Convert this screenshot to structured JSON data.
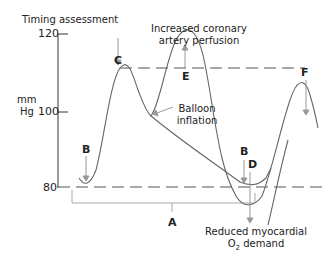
{
  "title": "Timing assessment",
  "y_axis": {
    "unit_line1": "mm",
    "unit_line2": "Hg",
    "ticks": [
      "120",
      "100",
      "80"
    ]
  },
  "annotations": {
    "increased_perfusion": [
      "Increased coronary",
      "artery perfusion"
    ],
    "balloon_inflation": [
      "Balloon",
      "inflation"
    ],
    "reduced_demand_line1": "Reduced myocardial",
    "reduced_demand_o": "O",
    "reduced_demand_sub": "2",
    "reduced_demand_rest": " demand"
  },
  "markers": {
    "A": "A",
    "B1": "B",
    "B2": "B",
    "C": "C",
    "D": "D",
    "E": "E",
    "F": "F"
  },
  "colors": {
    "curve": "#666666",
    "arrow": "#999999",
    "axis": "#333333",
    "dashed": "#555555"
  }
}
